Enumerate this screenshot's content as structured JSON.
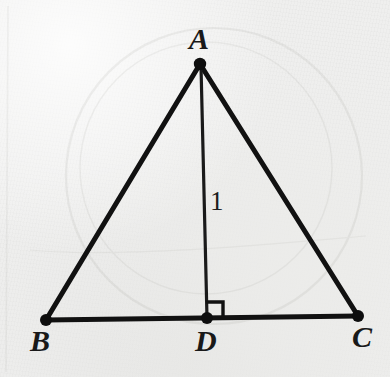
{
  "figure": {
    "kind": "geometry-diagram",
    "background_color": "#efefee",
    "ink_color": "#111111",
    "canvas": {
      "width": 390,
      "height": 377
    }
  },
  "points": [
    {
      "id": "A",
      "label": "A",
      "x": 200,
      "y": 64,
      "label_x": 189,
      "label_y": 24,
      "dot_r": 6
    },
    {
      "id": "B",
      "label": "B",
      "x": 46,
      "y": 320,
      "label_x": 30,
      "label_y": 326,
      "dot_r": 6
    },
    {
      "id": "D",
      "label": "D",
      "x": 207,
      "y": 318,
      "label_x": 195,
      "label_y": 326,
      "dot_r": 6
    },
    {
      "id": "C",
      "label": "C",
      "x": 358,
      "y": 316,
      "label_x": 352,
      "label_y": 322,
      "dot_r": 6
    }
  ],
  "segments": [
    {
      "id": "AB",
      "from": "A",
      "to": "B",
      "width": 5,
      "label": ""
    },
    {
      "id": "AC",
      "from": "A",
      "to": "C",
      "width": 5,
      "label": ""
    },
    {
      "id": "BC",
      "from": "B",
      "to": "C",
      "width": 5,
      "label": ""
    },
    {
      "id": "AD",
      "from": "A",
      "to": "D",
      "width": 3.2,
      "label": "1"
    }
  ],
  "measures": {
    "altitude_label": "1",
    "altitude_label_x": 210,
    "altitude_label_y": 188
  },
  "right_angle": {
    "at": "D",
    "label": "right-angle-mark",
    "size": 16,
    "opens": "up-right"
  },
  "labels": {
    "apex": "A",
    "base_left": "B",
    "foot": "D",
    "base_right": "C",
    "altitude": "1"
  }
}
